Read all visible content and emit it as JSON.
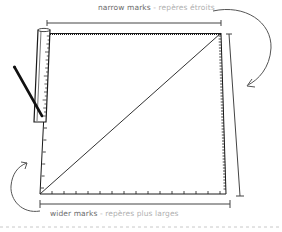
{
  "labels": {
    "top": {
      "english": "narrow marks",
      "separator": " - ",
      "french": "repères étroits"
    },
    "bottom": {
      "english": "wider marks",
      "separator": " - ",
      "french": "repères plus larges"
    }
  },
  "colors": {
    "ink": "#1a1a1a",
    "line": "#333333",
    "english_text": "#6b6b6b",
    "french_text": "#b0b0b0",
    "dashed_rule": "#c8c8c8",
    "background": "#ffffff"
  },
  "illustration": {
    "shape": "square-with-diagonal",
    "tools": [
      "ruler",
      "pencil"
    ],
    "annotations": [
      "top-dimension-line",
      "bottom-dimension-line",
      "right-dimension-line",
      "curved-arrow-right",
      "curved-arrow-left"
    ]
  }
}
